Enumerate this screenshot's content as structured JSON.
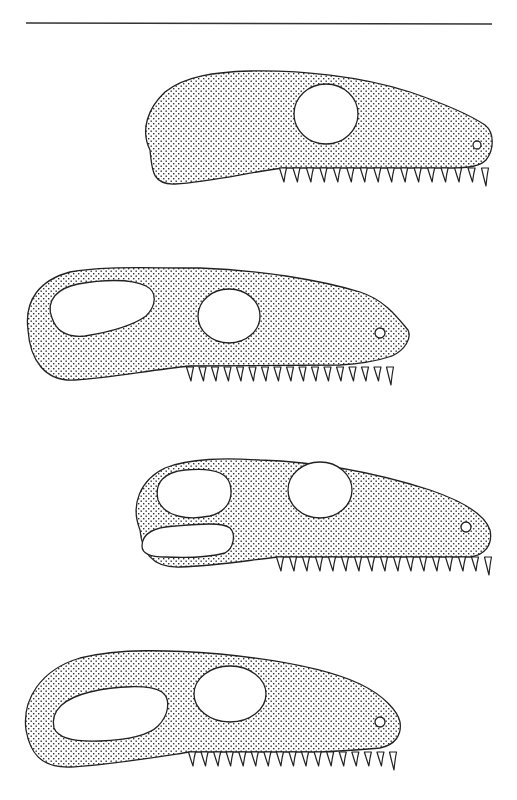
{
  "figure": {
    "type": "lateral skull outline comparison",
    "background": "#ffffff",
    "ink_color": "#222222",
    "fill_pattern": "stipple-dots",
    "top_rule": {
      "x1": 26,
      "y1": 23,
      "x2": 492,
      "y2": 24
    },
    "skulls": [
      {
        "id": "skull-1",
        "openings": [
          "orbit"
        ],
        "orbit": {
          "cx": 325,
          "cy": 113,
          "rx": 32,
          "ry": 30
        },
        "nostril": {
          "cx": 477,
          "cy": 145,
          "r": 4
        },
        "teeth": {
          "count": 16,
          "x_start": 283,
          "x_end": 485,
          "base_y": 168,
          "length": 14
        }
      },
      {
        "id": "skull-2",
        "openings": [
          "antorbital-fenestra",
          "orbit"
        ],
        "orbit": {
          "cx": 229,
          "cy": 316,
          "rx": 31,
          "ry": 27
        },
        "nostril": {
          "cx": 380,
          "cy": 333,
          "r": 5
        },
        "teeth": {
          "count": 17,
          "x_start": 190,
          "x_end": 390,
          "base_y": 367,
          "length": 14
        }
      },
      {
        "id": "skull-3",
        "openings": [
          "upper-fenestra",
          "lower-fenestra",
          "orbit"
        ],
        "orbit": {
          "cx": 320,
          "cy": 489,
          "rx": 32,
          "ry": 28
        },
        "nostril": {
          "cx": 466,
          "cy": 527,
          "r": 5
        },
        "teeth": {
          "count": 17,
          "x_start": 280,
          "x_end": 488,
          "base_y": 557,
          "length": 14
        }
      },
      {
        "id": "skull-4",
        "openings": [
          "antorbital-fenestra",
          "orbit"
        ],
        "orbit": {
          "cx": 230,
          "cy": 694,
          "rx": 36,
          "ry": 28
        },
        "nostril": {
          "cx": 380,
          "cy": 722,
          "r": 5
        },
        "teeth": {
          "count": 17,
          "x_start": 192,
          "x_end": 393,
          "base_y": 752,
          "length": 14
        }
      }
    ]
  }
}
